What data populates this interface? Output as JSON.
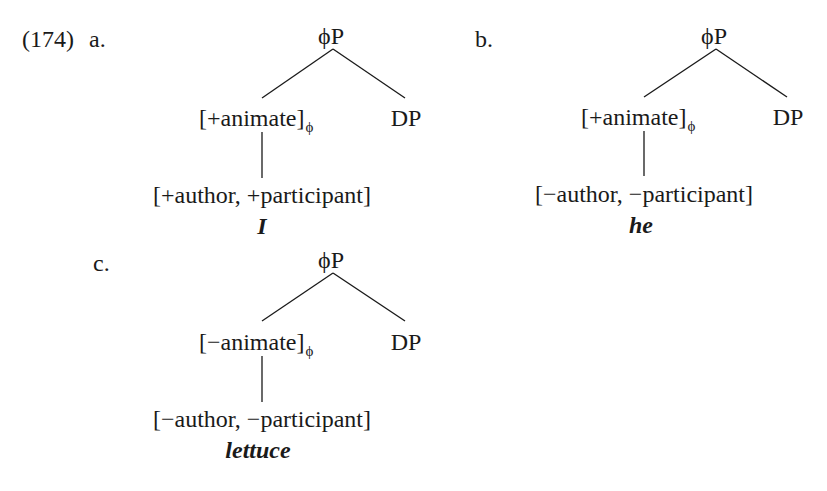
{
  "example": {
    "number": "(174)",
    "trees": [
      {
        "label": "a.",
        "root": "ϕP",
        "left": {
          "feature": "[+animate]",
          "subscript": "ϕ"
        },
        "right": "DP",
        "features": "[+author, +participant]",
        "lexeme": "I"
      },
      {
        "label": "b.",
        "root": "ϕP",
        "left": {
          "feature": "[+animate]",
          "subscript": "ϕ"
        },
        "right": "DP",
        "features": "[−author, −participant]",
        "lexeme": "he"
      },
      {
        "label": "c.",
        "root": "ϕP",
        "left": {
          "feature": "[−animate]",
          "subscript": "ϕ"
        },
        "right": "DP",
        "features": "[−author, −participant]",
        "lexeme": "lettuce"
      }
    ]
  }
}
